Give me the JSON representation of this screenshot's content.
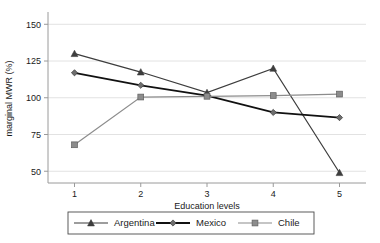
{
  "chart_data": {
    "type": "line",
    "title": "",
    "xlabel": "Education levels",
    "ylabel": "marginal MWR (%)",
    "categories": [
      "1",
      "2",
      "3",
      "4",
      "5"
    ],
    "x": [
      1,
      2,
      3,
      4,
      5
    ],
    "xlim": [
      0.6,
      5.4
    ],
    "ylim": [
      42,
      157
    ],
    "yticks": [
      50,
      75,
      100,
      125,
      150
    ],
    "xticks": [
      1,
      2,
      3,
      4,
      5
    ],
    "grid": "horizontal",
    "legend_position": "bottom",
    "series": [
      {
        "name": "Argentina",
        "marker": "triangle",
        "color": "#3d3d3d",
        "values": [
          130,
          117.5,
          103.5,
          120,
          49
        ]
      },
      {
        "name": "Mexico",
        "marker": "diamond",
        "color": "#111111",
        "values": [
          117,
          108.5,
          101.5,
          90,
          86.5
        ]
      },
      {
        "name": "Chile",
        "marker": "square",
        "color": "#8c8c8c",
        "values": [
          68,
          100.5,
          101,
          101.5,
          102.5
        ]
      }
    ]
  },
  "axes": {
    "y_tick_labels": [
      "150",
      "125",
      "100",
      "75",
      "50"
    ],
    "x_tick_labels": [
      "1",
      "2",
      "3",
      "4",
      "5"
    ],
    "y_axis_title": "marginal MWR (%)",
    "x_axis_title": "Education levels"
  },
  "legend": {
    "entries": [
      {
        "label": "Argentina",
        "marker": "triangle",
        "color": "#3d3d3d"
      },
      {
        "label": "Mexico",
        "marker": "diamond",
        "color": "#111111"
      },
      {
        "label": "Chile",
        "marker": "square",
        "color": "#8c8c8c"
      }
    ]
  },
  "colors": {
    "argentina": "#3d3d3d",
    "mexico": "#111111",
    "chile": "#8c8c8c",
    "grid": "#e2e2e2",
    "axis": "#9a9a9a",
    "text": "#1a1a1a",
    "background": "#ffffff"
  }
}
